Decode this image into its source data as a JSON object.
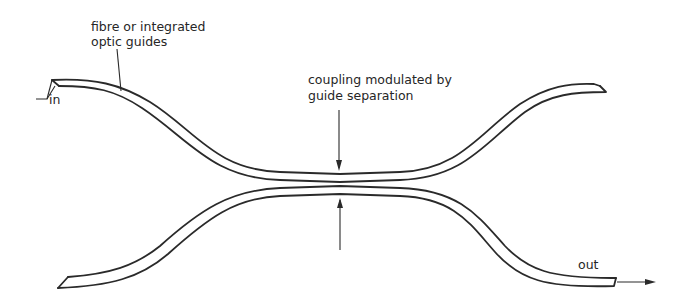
{
  "diagram": {
    "labels": {
      "guides_line1": "fibre or integrated",
      "guides_line2": "optic guides",
      "coupling_line1": "coupling modulated by",
      "coupling_line2": "guide separation",
      "input": "in",
      "output": "out"
    },
    "colors": {
      "stroke": "#2a2a2a",
      "background": "#ffffff"
    }
  }
}
